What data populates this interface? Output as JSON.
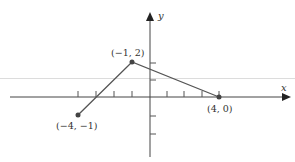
{
  "diagram": {
    "type": "coordinate-plane-piecewise-linear",
    "axes": {
      "x_label": "x",
      "y_label": "y",
      "x_ticks": [
        -4,
        -3,
        -2,
        -1,
        1,
        2,
        3,
        4
      ],
      "y_ticks": [
        -2,
        -1,
        1,
        2
      ]
    },
    "points": [
      {
        "x": -4,
        "y": -1,
        "label": "(−4, −1)"
      },
      {
        "x": -1,
        "y": 2,
        "label": "(−1, 2)"
      },
      {
        "x": 4,
        "y": 0,
        "label": "(4, 0)"
      }
    ],
    "colors": {
      "axis": "#444444",
      "segment": "#555555",
      "point": "#444444",
      "background_band": "#dcdcdc"
    }
  }
}
